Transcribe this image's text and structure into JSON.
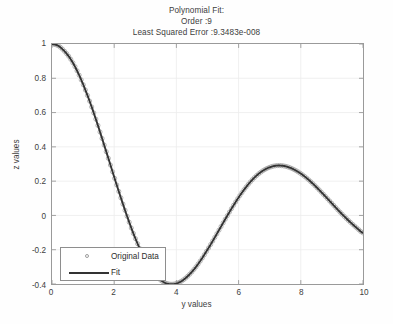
{
  "figure": {
    "title_lines": [
      "Polynomial Fit:",
      "Order :9",
      "Least Squared Error :9.3483e-008"
    ],
    "background": "#fefefe",
    "axes_color": "#9a9a9a",
    "grid_color": "#ececec"
  },
  "axis": {
    "xlabel": "y values",
    "ylabel": "z values",
    "xticks": [
      "0",
      "2",
      "4",
      "6",
      "8",
      "10"
    ],
    "yticks": [
      "-0.4",
      "-0.2",
      "0",
      "0.2",
      "0.4",
      "0.6",
      "0.8",
      "1"
    ]
  },
  "legend": {
    "entries": [
      {
        "label": "Original Data",
        "style": "circle-marker",
        "color": "#9d9d9d"
      },
      {
        "label": "Fit",
        "style": "solid-line",
        "color": "#333333"
      }
    ]
  },
  "chart_data": {
    "type": "line",
    "title": "Polynomial Fit: Order :9 Least Squared Error :9.3483e-008",
    "xlabel": "y values",
    "ylabel": "z values",
    "xlim": [
      0,
      10
    ],
    "ylim": [
      -0.4,
      1.0
    ],
    "xticks": [
      0,
      2,
      4,
      6,
      8,
      10
    ],
    "yticks": [
      -0.4,
      -0.2,
      0,
      0.2,
      0.4,
      0.6,
      0.8,
      1
    ],
    "grid": true,
    "legend_position": "lower-left",
    "annotations": {
      "order": 9,
      "least_squared_error": "9.3483e-008"
    },
    "series": [
      {
        "name": "Original Data",
        "type": "scatter",
        "marker": "circle",
        "color": "#9d9d9d",
        "x": [
          0,
          0.2,
          0.4,
          0.6,
          0.8,
          1,
          1.2,
          1.4,
          1.6,
          1.8,
          2,
          2.2,
          2.4,
          2.6,
          2.8,
          3,
          3.2,
          3.4,
          3.6,
          3.8,
          4,
          4.2,
          4.4,
          4.6,
          4.8,
          5,
          5.2,
          5.4,
          5.6,
          5.8,
          6,
          6.2,
          6.4,
          6.6,
          6.8,
          7,
          7.2,
          7.4,
          7.6,
          7.8,
          8,
          8.2,
          8.4,
          8.6,
          8.8,
          9,
          9.2,
          9.4,
          9.6,
          9.8,
          10
        ],
        "y": [
          1.0,
          0.99,
          0.958,
          0.912,
          0.846,
          0.765,
          0.671,
          0.567,
          0.455,
          0.34,
          0.224,
          0.111,
          0.003,
          -0.097,
          -0.185,
          -0.26,
          -0.32,
          -0.363,
          -0.39,
          -0.401,
          -0.397,
          -0.379,
          -0.348,
          -0.307,
          -0.257,
          -0.2,
          -0.139,
          -0.076,
          -0.013,
          0.048,
          0.105,
          0.156,
          0.2,
          0.236,
          0.263,
          0.281,
          0.29,
          0.29,
          0.282,
          0.266,
          0.244,
          0.216,
          0.183,
          0.147,
          0.109,
          0.07,
          0.031,
          -0.006,
          -0.041,
          -0.073,
          -0.102
        ]
      },
      {
        "name": "Fit",
        "type": "line",
        "color": "#333333",
        "x": [
          0,
          0.2,
          0.4,
          0.6,
          0.8,
          1,
          1.2,
          1.4,
          1.6,
          1.8,
          2,
          2.2,
          2.4,
          2.6,
          2.8,
          3,
          3.2,
          3.4,
          3.6,
          3.8,
          4,
          4.2,
          4.4,
          4.6,
          4.8,
          5,
          5.2,
          5.4,
          5.6,
          5.8,
          6,
          6.2,
          6.4,
          6.6,
          6.8,
          7,
          7.2,
          7.4,
          7.6,
          7.8,
          8,
          8.2,
          8.4,
          8.6,
          8.8,
          9,
          9.2,
          9.4,
          9.6,
          9.8,
          10
        ],
        "y": [
          1.0,
          0.99,
          0.958,
          0.912,
          0.846,
          0.765,
          0.671,
          0.567,
          0.455,
          0.34,
          0.224,
          0.111,
          0.003,
          -0.097,
          -0.185,
          -0.26,
          -0.32,
          -0.363,
          -0.39,
          -0.401,
          -0.397,
          -0.379,
          -0.348,
          -0.307,
          -0.257,
          -0.2,
          -0.139,
          -0.076,
          -0.013,
          0.048,
          0.105,
          0.156,
          0.2,
          0.236,
          0.263,
          0.281,
          0.29,
          0.29,
          0.282,
          0.266,
          0.244,
          0.216,
          0.183,
          0.147,
          0.109,
          0.07,
          0.031,
          -0.006,
          -0.041,
          -0.073,
          -0.102
        ]
      }
    ],
    "key_features": {
      "start_value": 1.0,
      "first_zero_crossing": 3.2,
      "minimum": {
        "x": 4.4,
        "y": -0.22
      },
      "second_zero_crossing": 6.35,
      "maximum": {
        "x": 7.6,
        "y": 0.122
      },
      "end_value": -0.065
    }
  }
}
